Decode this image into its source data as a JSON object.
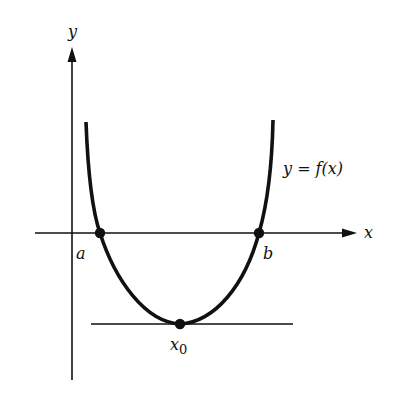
{
  "diagram": {
    "axes": {
      "x_label": "x",
      "y_label": "y"
    },
    "curve_label": "y = f(x)",
    "points": [
      {
        "id": "a",
        "label": "a",
        "description": "root where curve crosses x-axis (left)"
      },
      {
        "id": "b",
        "label": "b",
        "description": "root where curve crosses x-axis (right)"
      },
      {
        "id": "x0",
        "label": "x",
        "subscript": "0",
        "description": "minimum point with horizontal tangent"
      }
    ],
    "tangent_line": "horizontal tangent at minimum x0"
  }
}
